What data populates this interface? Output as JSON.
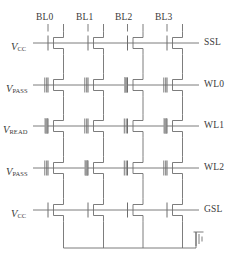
{
  "figure": {
    "type": "circuit-schematic",
    "line_color": "#6e6e6e",
    "text_color": "#3a3a3a",
    "background": "#ffffff",
    "programmed_gate_color": "#9a9a9a"
  },
  "bitlines": [
    {
      "label": "BL0",
      "x": 48
    },
    {
      "label": "BL1",
      "x": 88
    },
    {
      "label": "BL2",
      "x": 127.5
    },
    {
      "label": "BL3",
      "x": 167
    }
  ],
  "rows": [
    {
      "id": "ssl",
      "right_label": "SSL",
      "left_label": {
        "symbol": "V",
        "subscript": "CC"
      },
      "y": 43,
      "gate_type": "single",
      "cells": [
        {
          "bitline": "BL0",
          "programmed": false
        },
        {
          "bitline": "BL1",
          "programmed": false
        },
        {
          "bitline": "BL2",
          "programmed": false
        },
        {
          "bitline": "BL3",
          "programmed": false
        }
      ]
    },
    {
      "id": "wl0",
      "right_label": "WL0",
      "left_label": {
        "symbol": "V",
        "subscript": "PASS"
      },
      "y": 85,
      "gate_type": "floating",
      "cells": [
        {
          "bitline": "BL0",
          "programmed": false
        },
        {
          "bitline": "BL1",
          "programmed": false
        },
        {
          "bitline": "BL2",
          "programmed": true
        },
        {
          "bitline": "BL3",
          "programmed": false
        }
      ]
    },
    {
      "id": "wl1",
      "right_label": "WL1",
      "left_label": {
        "symbol": "V",
        "subscript": "READ"
      },
      "y": 126,
      "gate_type": "floating",
      "cells": [
        {
          "bitline": "BL0",
          "programmed": true
        },
        {
          "bitline": "BL1",
          "programmed": false
        },
        {
          "bitline": "BL2",
          "programmed": false
        },
        {
          "bitline": "BL3",
          "programmed": true
        }
      ]
    },
    {
      "id": "wl2",
      "right_label": "WL2",
      "left_label": {
        "symbol": "V",
        "subscript": "PASS"
      },
      "y": 168,
      "gate_type": "floating",
      "cells": [
        {
          "bitline": "BL0",
          "programmed": false
        },
        {
          "bitline": "BL1",
          "programmed": true
        },
        {
          "bitline": "BL2",
          "programmed": false
        },
        {
          "bitline": "BL3",
          "programmed": false
        }
      ]
    },
    {
      "id": "gsl",
      "right_label": "GSL",
      "left_label": {
        "symbol": "V",
        "subscript": "CC"
      },
      "y": 210,
      "gate_type": "single",
      "cells": [
        {
          "bitline": "BL0",
          "programmed": false
        },
        {
          "bitline": "BL1",
          "programmed": false
        },
        {
          "bitline": "BL2",
          "programmed": false
        },
        {
          "bitline": "BL3",
          "programmed": false
        }
      ]
    }
  ],
  "ground": {
    "name": "ground-symbol",
    "rail_y": 248,
    "x": 196
  },
  "labels": {
    "bl0": "BL0",
    "bl1": "BL1",
    "bl2": "BL2",
    "bl3": "BL3",
    "ssl": "SSL",
    "wl0": "WL0",
    "wl1": "WL1",
    "wl2": "WL2",
    "gsl": "GSL",
    "v_symbol": "V",
    "sub_cc": "CC",
    "sub_pass": "PASS",
    "sub_read": "READ"
  }
}
